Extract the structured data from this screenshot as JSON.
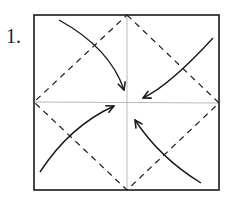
{
  "diagram": {
    "step_number": "1.",
    "square": {
      "x": 34,
      "y": 15,
      "width": 185,
      "height": 175
    },
    "center": {
      "x": 127,
      "y": 102
    },
    "colors": {
      "outline": "#1a1a1a",
      "crease": "#b8b8b8",
      "dashed": "#1a1a1a",
      "arrow": "#1a1a1a"
    },
    "arrows": [
      {
        "from": "top-left corner",
        "to": "center"
      },
      {
        "from": "top-right corner",
        "to": "center"
      },
      {
        "from": "bottom-left corner",
        "to": "center"
      },
      {
        "from": "bottom-right corner",
        "to": "center"
      }
    ]
  }
}
